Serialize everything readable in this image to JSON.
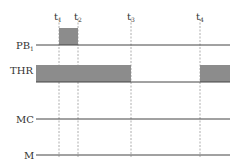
{
  "diagram": {
    "type": "timing-diagram",
    "time_markers": [
      {
        "label": "t",
        "sub": "1",
        "x": 59
      },
      {
        "label": "t",
        "sub": "2",
        "x": 78
      },
      {
        "label": "t",
        "sub": "3",
        "x": 131
      },
      {
        "label": "t",
        "sub": "4",
        "x": 200
      }
    ],
    "signals": [
      {
        "name": "PB",
        "sub": "1",
        "y": 45,
        "pulses": [
          {
            "from": "t1",
            "to": "t2"
          }
        ]
      },
      {
        "name": "THR",
        "sub": "",
        "y": 82,
        "pulses": [
          {
            "from": "start",
            "to": "t3"
          },
          {
            "from": "t4",
            "to": "end"
          }
        ]
      },
      {
        "name": "MC",
        "sub": "",
        "y": 119,
        "pulses": []
      },
      {
        "name": "M",
        "sub": "",
        "y": 155,
        "pulses": []
      }
    ],
    "colors": {
      "line": "#444444",
      "fill": "#8c8c8c",
      "dash": "#999999"
    }
  }
}
